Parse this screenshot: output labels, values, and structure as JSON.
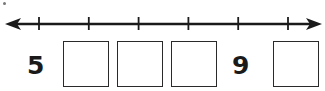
{
  "number_line": {
    "tick_count": 6,
    "arrows": "both"
  },
  "sequence": [
    {
      "type": "label",
      "value": "5"
    },
    {
      "type": "blank",
      "value": ""
    },
    {
      "type": "blank",
      "value": ""
    },
    {
      "type": "blank",
      "value": ""
    },
    {
      "type": "label",
      "value": "9"
    },
    {
      "type": "blank",
      "value": ""
    }
  ],
  "colors": {
    "line": "#1a1a1a",
    "box_border": "#2a2a2a"
  }
}
